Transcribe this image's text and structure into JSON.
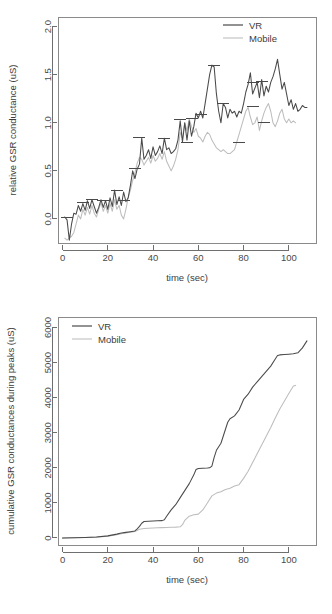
{
  "page": {
    "background": "#ffffff",
    "width": 332,
    "height": 614
  },
  "colors": {
    "vr": "#4a4a4a",
    "mobile": "#bdbdbd",
    "axis": "#6f6f6f",
    "text": "#3c3c3c"
  },
  "figures": {
    "top": {
      "ylabel": "relative GSR conductance (uS)",
      "xlabel": "time (sec)",
      "legend": {
        "vr": "VR",
        "mobile": "Mobile"
      },
      "yticks": [
        "0.0",
        "0.5",
        "1.0",
        "1.5",
        "2.0"
      ],
      "xticks": [
        "0",
        "20",
        "40",
        "60",
        "80",
        "100"
      ]
    },
    "bottom": {
      "ylabel": "cumulative GSR conductances during peaks (uS)",
      "xlabel": "time (sec)",
      "legend": {
        "vr": "VR",
        "mobile": "Mobile"
      },
      "yticks": [
        "0",
        "1000",
        "2000",
        "3000",
        "4000",
        "5000",
        "6000"
      ],
      "xticks": [
        "0",
        "20",
        "40",
        "60",
        "80",
        "100"
      ]
    }
  },
  "chart_data": [
    {
      "id": "relative-gsr-conductance",
      "type": "line",
      "title": "",
      "xlabel": "time (sec)",
      "ylabel": "relative GSR conductance (uS)",
      "xlim": [
        -2,
        112
      ],
      "ylim": [
        -0.25,
        2.1
      ],
      "xticks": [
        0,
        20,
        40,
        60,
        80,
        100
      ],
      "yticks": [
        0.0,
        0.5,
        1.0,
        1.5,
        2.0
      ],
      "grid": false,
      "legend_position": "top-right",
      "series": [
        {
          "name": "VR",
          "color": "#4a4a4a",
          "x": [
            1,
            2,
            3,
            4,
            5,
            6,
            7,
            8,
            9,
            10,
            11,
            12,
            13,
            14,
            15,
            16,
            17,
            18,
            19,
            20,
            21,
            22,
            23,
            24,
            25,
            26,
            27,
            28,
            29,
            30,
            31,
            32,
            33,
            34,
            35,
            36,
            37,
            38,
            39,
            40,
            41,
            42,
            43,
            44,
            45,
            46,
            47,
            48,
            49,
            50,
            51,
            52,
            53,
            54,
            55,
            56,
            57,
            58,
            59,
            60,
            61,
            62,
            63,
            64,
            65,
            66,
            67,
            68,
            69,
            70,
            71,
            72,
            73,
            74,
            75,
            76,
            77,
            78,
            79,
            80,
            81,
            82,
            83,
            84,
            85,
            86,
            87,
            88,
            89,
            90,
            91,
            92,
            93,
            94,
            95,
            96,
            97,
            98,
            99,
            100,
            101,
            102,
            103,
            104,
            105,
            106,
            107,
            108
          ],
          "y": [
            0.02,
            -0.01,
            -0.22,
            -0.05,
            0.06,
            0.05,
            0.14,
            0.08,
            0.16,
            0.09,
            0.19,
            0.11,
            0.2,
            0.13,
            0.06,
            0.12,
            0.2,
            0.12,
            0.19,
            0.1,
            0.22,
            0.13,
            0.3,
            0.15,
            0.23,
            0.14,
            0.28,
            0.18,
            0.22,
            0.35,
            0.5,
            0.42,
            0.52,
            0.57,
            0.84,
            0.62,
            0.66,
            0.72,
            0.63,
            0.75,
            0.66,
            0.7,
            0.76,
            0.68,
            0.84,
            0.72,
            0.74,
            0.68,
            0.7,
            0.73,
            0.82,
            1.02,
            0.8,
            1.0,
            0.82,
            1.02,
            0.86,
            0.96,
            1.1,
            1.05,
            1.12,
            1.05,
            1.2,
            1.35,
            1.5,
            1.6,
            1.58,
            1.3,
            1.12,
            1.0,
            1.2,
            1.16,
            1.05,
            1.14,
            1.1,
            1.12,
            1.06,
            1.12,
            1.1,
            1.2,
            1.32,
            1.4,
            1.52,
            1.3,
            1.36,
            1.42,
            1.26,
            1.45,
            1.28,
            1.38,
            1.32,
            1.42,
            1.48,
            1.56,
            1.66,
            1.5,
            1.35,
            1.42,
            1.3,
            1.18,
            1.24,
            1.14,
            1.2,
            1.12,
            1.14,
            1.18,
            1.16,
            1.16
          ]
        },
        {
          "name": "Mobile",
          "color": "#bdbdbd",
          "x": [
            1,
            2,
            3,
            4,
            5,
            6,
            7,
            8,
            9,
            10,
            11,
            12,
            13,
            14,
            15,
            16,
            17,
            18,
            19,
            20,
            21,
            22,
            23,
            24,
            25,
            26,
            27,
            28,
            29,
            30,
            31,
            32,
            33,
            34,
            35,
            36,
            37,
            38,
            39,
            40,
            41,
            42,
            43,
            44,
            45,
            46,
            47,
            48,
            49,
            50,
            51,
            52,
            53,
            54,
            55,
            56,
            57,
            58,
            59,
            60,
            61,
            62,
            63,
            64,
            65,
            66,
            67,
            68,
            69,
            70,
            71,
            72,
            73,
            74,
            75,
            76,
            77,
            78,
            79,
            80,
            81,
            82,
            83,
            84,
            85,
            86,
            87,
            88,
            89,
            90,
            91,
            92,
            93,
            94,
            95,
            96,
            97,
            98,
            99,
            100,
            101,
            102,
            103
          ],
          "y": [
            -0.2,
            -0.22,
            -0.2,
            -0.18,
            -0.14,
            -0.05,
            0.04,
            0.0,
            0.1,
            0.04,
            0.12,
            0.05,
            0.14,
            0.06,
            0.02,
            0.1,
            0.17,
            0.08,
            0.14,
            0.06,
            0.16,
            0.08,
            0.2,
            0.1,
            0.14,
            0.04,
            0.0,
            0.1,
            0.22,
            0.3,
            0.4,
            0.48,
            0.58,
            0.64,
            0.62,
            0.56,
            0.6,
            0.64,
            0.58,
            0.66,
            0.6,
            0.63,
            0.68,
            0.62,
            0.7,
            0.6,
            0.55,
            0.5,
            0.55,
            0.62,
            0.72,
            0.9,
            0.84,
            1.0,
            0.92,
            1.04,
            0.96,
            0.9,
            0.94,
            0.86,
            0.84,
            0.8,
            0.86,
            0.9,
            0.88,
            0.82,
            0.78,
            0.74,
            0.72,
            0.7,
            0.72,
            0.7,
            0.68,
            0.68,
            0.7,
            0.72,
            0.8,
            0.88,
            0.96,
            1.04,
            1.12,
            1.16,
            1.06,
            0.98,
            1.0,
            1.06,
            0.92,
            1.02,
            1.1,
            1.16,
            1.2,
            1.12,
            1.0,
            0.96,
            1.02,
            1.1,
            1.14,
            1.04,
            1.0,
            1.04,
            1.0,
            1.02,
            1.0
          ]
        }
      ],
      "peak_markers": [
        {
          "x": 2,
          "y": 0.02
        },
        {
          "x": 9,
          "y": 0.17
        },
        {
          "x": 13,
          "y": 0.2
        },
        {
          "x": 18,
          "y": 0.19
        },
        {
          "x": 24,
          "y": 0.3
        },
        {
          "x": 27,
          "y": 0.19
        },
        {
          "x": 32,
          "y": 0.52
        },
        {
          "x": 34,
          "y": 0.85
        },
        {
          "x": 45,
          "y": 0.84
        },
        {
          "x": 52,
          "y": 1.03
        },
        {
          "x": 55,
          "y": 0.79
        },
        {
          "x": 57,
          "y": 1.04
        },
        {
          "x": 61,
          "y": 1.09
        },
        {
          "x": 67,
          "y": 1.6
        },
        {
          "x": 71,
          "y": 1.2
        },
        {
          "x": 78,
          "y": 0.8
        },
        {
          "x": 84,
          "y": 1.42
        },
        {
          "x": 84,
          "y": 1.17
        },
        {
          "x": 88,
          "y": 1.43
        },
        {
          "x": 89,
          "y": 1.0
        }
      ]
    },
    {
      "id": "cumulative-gsr-conductances",
      "type": "line",
      "title": "",
      "xlabel": "time (sec)",
      "ylabel": "cumulative GSR conductances during peaks (uS)",
      "xlim": [
        -2,
        112
      ],
      "ylim": [
        -200,
        6300
      ],
      "xticks": [
        0,
        20,
        40,
        60,
        80,
        100
      ],
      "yticks": [
        0,
        1000,
        2000,
        3000,
        4000,
        5000,
        6000
      ],
      "grid": false,
      "legend_position": "top-left",
      "series": [
        {
          "name": "VR",
          "color": "#4a4a4a",
          "x": [
            0,
            5,
            10,
            15,
            20,
            24,
            26,
            28,
            30,
            32,
            33,
            34,
            35,
            36,
            38,
            40,
            42,
            44,
            45,
            46,
            48,
            50,
            52,
            54,
            56,
            58,
            59,
            60,
            62,
            64,
            65,
            66,
            67,
            68,
            70,
            71,
            72,
            73,
            74,
            76,
            78,
            79,
            80,
            82,
            84,
            86,
            88,
            90,
            92,
            94,
            95,
            96,
            98,
            100,
            102,
            104,
            106,
            108
          ],
          "y": [
            0,
            5,
            15,
            30,
            60,
            110,
            140,
            160,
            180,
            200,
            260,
            330,
            420,
            470,
            480,
            485,
            490,
            495,
            520,
            620,
            800,
            950,
            1150,
            1350,
            1550,
            1800,
            1950,
            1980,
            1990,
            1995,
            2000,
            2050,
            2300,
            2500,
            2700,
            2900,
            3100,
            3300,
            3400,
            3480,
            3650,
            3800,
            3950,
            4100,
            4300,
            4450,
            4600,
            4750,
            4900,
            5100,
            5200,
            5220,
            5230,
            5240,
            5250,
            5280,
            5420,
            5620
          ]
        },
        {
          "name": "Mobile",
          "color": "#bdbdbd",
          "x": [
            0,
            5,
            10,
            15,
            20,
            24,
            26,
            28,
            30,
            32,
            34,
            36,
            38,
            40,
            42,
            44,
            46,
            48,
            50,
            52,
            53,
            54,
            56,
            58,
            60,
            62,
            64,
            66,
            68,
            70,
            72,
            74,
            76,
            78,
            80,
            82,
            84,
            86,
            88,
            90,
            92,
            94,
            96,
            98,
            100,
            102,
            103
          ],
          "y": [
            0,
            5,
            12,
            25,
            50,
            95,
            120,
            145,
            165,
            185,
            250,
            270,
            280,
            285,
            290,
            295,
            300,
            305,
            310,
            320,
            380,
            500,
            620,
            660,
            680,
            800,
            1000,
            1200,
            1280,
            1320,
            1380,
            1420,
            1480,
            1520,
            1700,
            1900,
            2150,
            2400,
            2650,
            2900,
            3150,
            3420,
            3680,
            3900,
            4120,
            4330,
            4350
          ]
        }
      ]
    }
  ]
}
